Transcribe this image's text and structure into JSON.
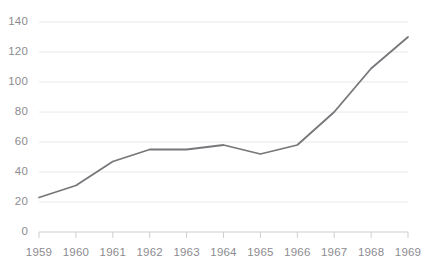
{
  "chart_data": {
    "type": "line",
    "title": "",
    "subtitle": "",
    "xlabel": "",
    "ylabel": "",
    "categories": [
      "1959",
      "1960",
      "1961",
      "1962",
      "1963",
      "1964",
      "1965",
      "1966",
      "1967",
      "1968",
      "1969"
    ],
    "x": [
      1959,
      1960,
      1961,
      1962,
      1963,
      1964,
      1965,
      1966,
      1967,
      1968,
      1969
    ],
    "values": [
      23,
      31,
      47,
      55,
      55,
      58,
      52,
      58,
      80,
      109,
      130
    ],
    "series": [
      {
        "name": "",
        "values": [
          23,
          31,
          47,
          55,
          55,
          58,
          52,
          58,
          80,
          109,
          130
        ]
      }
    ],
    "ylim": [
      0,
      140
    ],
    "yticks": [
      0,
      20,
      40,
      60,
      80,
      100,
      120,
      140
    ],
    "ytick_labels": [
      "0",
      "20",
      "40",
      "60",
      "80",
      "100",
      "120",
      "140"
    ],
    "xtick_labels": [
      "1959",
      "1960",
      "1961",
      "1962",
      "1963",
      "1964",
      "1965",
      "1966",
      "1967",
      "1968",
      "1969"
    ],
    "grid": "horizontal",
    "legend": "none",
    "markers": false,
    "annotations": [],
    "colors": {
      "line": "#77767a",
      "gridline": "#e8e8ea",
      "axis_tick": "#cfcfd2",
      "label_text": "#8d8b90",
      "background": "#ffffff"
    },
    "line_width": 1.8
  }
}
